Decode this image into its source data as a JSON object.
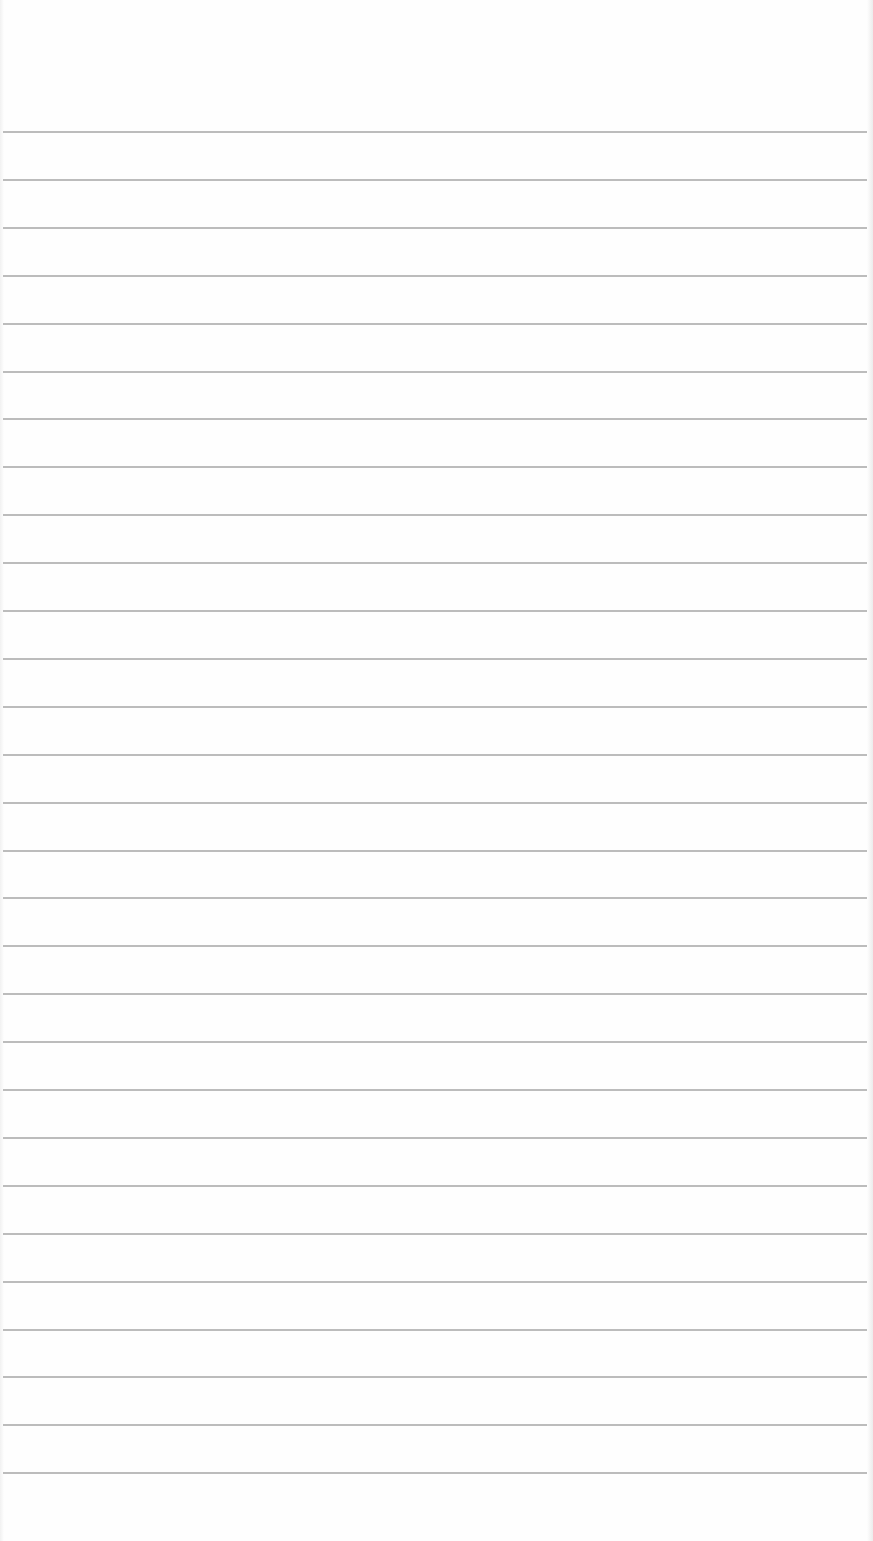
{
  "page": {
    "type": "lined-paper",
    "background_color": "#fefefe",
    "rule_color": "#b0b0b0",
    "rule_count": 29,
    "first_rule_y": 131,
    "rule_spacing_px": 47.9
  }
}
